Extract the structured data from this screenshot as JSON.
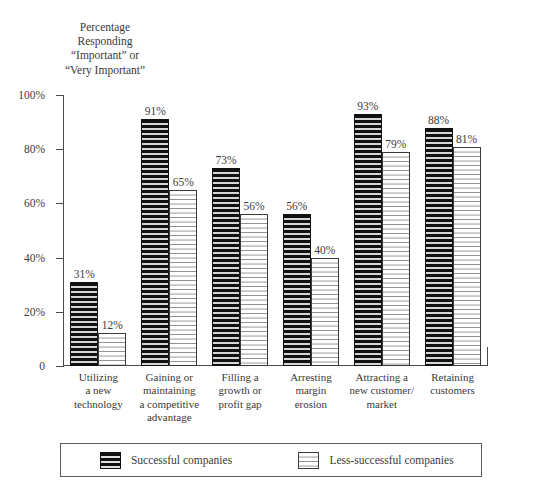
{
  "chart_data": {
    "type": "bar",
    "title": "Percentage\nResponding\n“Important” or\n“Very Important”",
    "xlabel": "",
    "ylabel": "",
    "ylim": [
      0,
      100
    ],
    "grid": false,
    "legend_position": "bottom",
    "categories": [
      "Utilizing\na new\ntechnology",
      "Gaining or\nmaintaining\na competitive\nadvantage",
      "Filling a\ngrowth or\nprofit gap",
      "Arresting\nmargin\nerosion",
      "Attracting a\nnew customer/\nmarket",
      "Retaining\ncustomers"
    ],
    "tick_labels": [
      "0",
      "20%",
      "40%",
      "60%",
      "80%",
      "100%"
    ],
    "tick_values": [
      0,
      20,
      40,
      60,
      80,
      100
    ],
    "series": [
      {
        "name": "Successful companies",
        "values": [
          31,
          91,
          73,
          56,
          93,
          88
        ],
        "value_labels": [
          "31%",
          "91%",
          "73%",
          "56%",
          "93%",
          "88%"
        ],
        "color": "#111111",
        "pattern": "dark-brick"
      },
      {
        "name": "Less-successful companies",
        "values": [
          12,
          65,
          56,
          40,
          79,
          81
        ],
        "value_labels": [
          "12%",
          "65%",
          "56%",
          "40%",
          "79%",
          "81%"
        ],
        "color": "#ffffff",
        "pattern": "light-stipple"
      }
    ]
  }
}
